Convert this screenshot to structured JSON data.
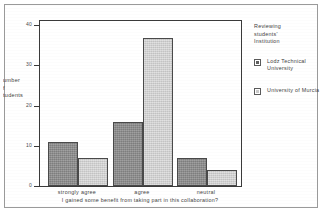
{
  "chart_data": {
    "type": "bar",
    "title": "",
    "subtitle": "",
    "categories": [
      "strongly agree",
      "agree",
      "neutral"
    ],
    "series": [
      {
        "name": "Lodz Technical University",
        "values": [
          11,
          16,
          7
        ],
        "color": "#8d8d8d"
      },
      {
        "name": "University of Murcia",
        "values": [
          7,
          37,
          4
        ],
        "color": "#d6d6d6"
      }
    ],
    "xlabel": "I gained some benefit from taking part in this collaboration?",
    "ylabel": "Number of students",
    "ylabel_visible": "umber\nf\ntudents",
    "ylim": [
      0,
      41
    ],
    "yticks": [
      0,
      10,
      20,
      30,
      40
    ],
    "ytick_labels": [
      "0",
      "10",
      "20",
      "30",
      "40"
    ],
    "grid": false,
    "legend_position": "right",
    "legend_title": "Reviewing students' Institution"
  },
  "legend": {
    "title_lines": [
      "Reviewing",
      "students'",
      "Institution"
    ],
    "entries": [
      {
        "label": "Lodz Technical University"
      },
      {
        "label": "University of Murcia"
      }
    ]
  },
  "axes": {
    "y_title_lines": [
      "umber",
      "f",
      "tudents"
    ],
    "x_title": "I gained some benefit from taking part in this collaboration?",
    "y_tick_0": "0",
    "y_tick_1": "10",
    "y_tick_2": "20",
    "y_tick_3": "30",
    "y_tick_4": "40"
  },
  "x_labels": {
    "cat_0": "strongly agree",
    "cat_1": "agree",
    "cat_2": "neutral"
  }
}
